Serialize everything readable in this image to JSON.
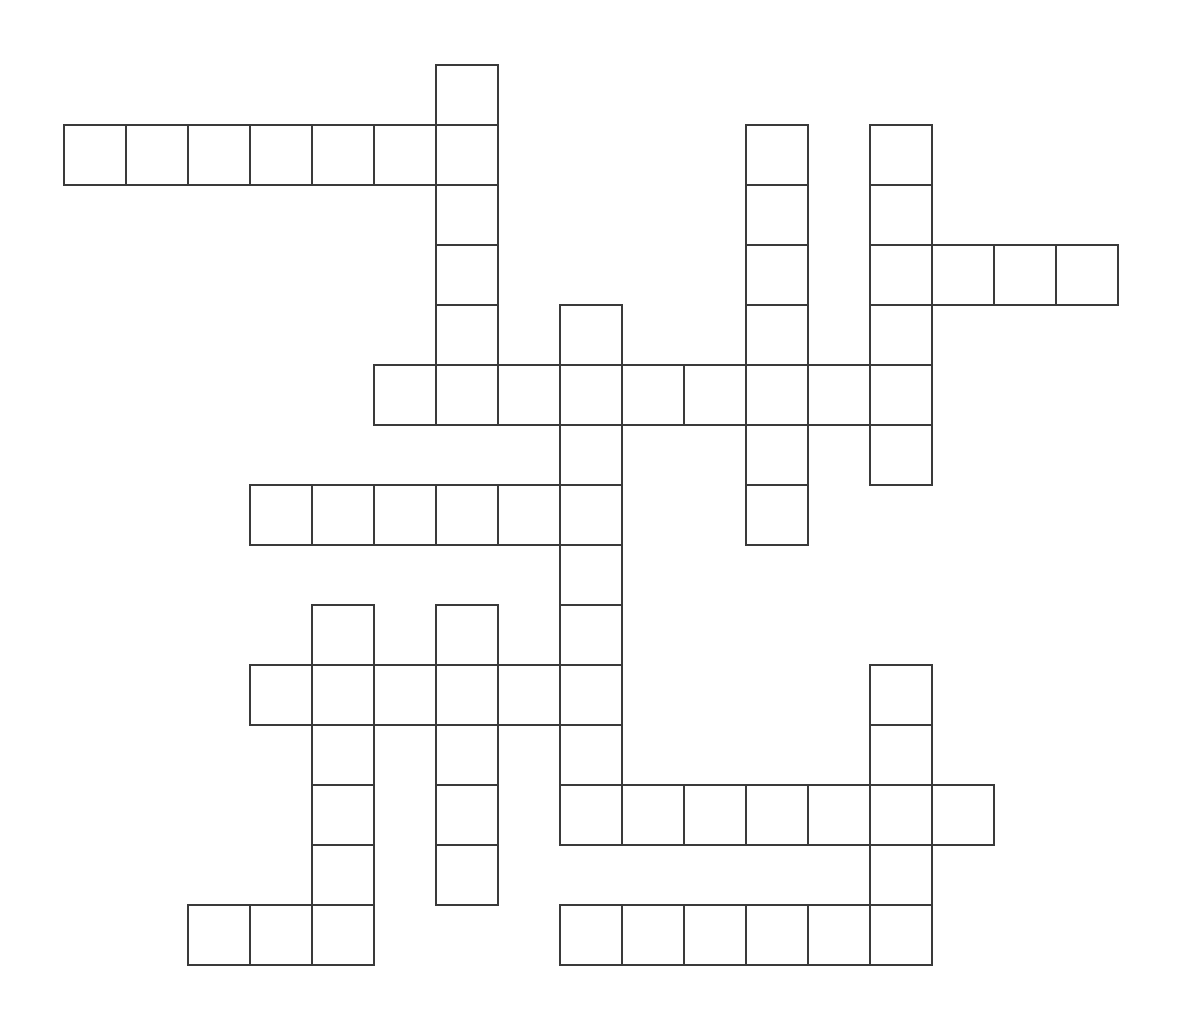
{
  "puzzle": {
    "type": "crossword",
    "origin_x": 63,
    "origin_y": 64,
    "cell_w": 62,
    "cell_h": 60,
    "line_color": "#3a3a3a",
    "words": [
      {
        "id": "across-row1",
        "dir": "across",
        "row": 1,
        "col": 0,
        "length": 7
      },
      {
        "id": "across-row3",
        "dir": "across",
        "row": 3,
        "col": 13,
        "length": 4
      },
      {
        "id": "across-row5",
        "dir": "across",
        "row": 5,
        "col": 5,
        "length": 9
      },
      {
        "id": "across-row7",
        "dir": "across",
        "row": 7,
        "col": 3,
        "length": 6
      },
      {
        "id": "across-row10",
        "dir": "across",
        "row": 10,
        "col": 3,
        "length": 6
      },
      {
        "id": "across-row12",
        "dir": "across",
        "row": 12,
        "col": 8,
        "length": 7
      },
      {
        "id": "across-row14a",
        "dir": "across",
        "row": 14,
        "col": 2,
        "length": 3
      },
      {
        "id": "across-row14b",
        "dir": "across",
        "row": 14,
        "col": 8,
        "length": 6
      },
      {
        "id": "down-col6a",
        "dir": "down",
        "row": 0,
        "col": 6,
        "length": 6
      },
      {
        "id": "down-col11",
        "dir": "down",
        "row": 1,
        "col": 11,
        "length": 7
      },
      {
        "id": "down-col13a",
        "dir": "down",
        "row": 1,
        "col": 13,
        "length": 6
      },
      {
        "id": "down-col8",
        "dir": "down",
        "row": 4,
        "col": 8,
        "length": 9
      },
      {
        "id": "down-col4",
        "dir": "down",
        "row": 9,
        "col": 4,
        "length": 6
      },
      {
        "id": "down-col6b",
        "dir": "down",
        "row": 9,
        "col": 6,
        "length": 5
      },
      {
        "id": "down-col13b",
        "dir": "down",
        "row": 10,
        "col": 13,
        "length": 5
      }
    ]
  }
}
